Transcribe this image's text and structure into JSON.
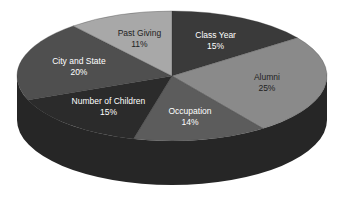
{
  "chart_data": {
    "type": "pie",
    "title": "",
    "style": "3d",
    "start_angle": "12 o'clock",
    "direction": "clockwise",
    "slices": [
      {
        "label": "Class Year",
        "value": 15,
        "display": "15%",
        "color": "#3a3a3a",
        "text_color": "#ffffff"
      },
      {
        "label": "Alumni",
        "value": 25,
        "display": "25%",
        "color": "#8a8a8a",
        "text_color": "#222222"
      },
      {
        "label": "Occupation",
        "value": 14,
        "display": "14%",
        "color": "#5c5c5c",
        "text_color": "#ffffff"
      },
      {
        "label": "Number of Children",
        "value": 15,
        "display": "15%",
        "color": "#2b2b2b",
        "text_color": "#ffffff"
      },
      {
        "label": "City and State",
        "value": 20,
        "display": "20%",
        "color": "#4f4f4f",
        "text_color": "#ffffff"
      },
      {
        "label": "Past Giving",
        "value": 11,
        "display": "11%",
        "color": "#a8a8a8",
        "text_color": "#222222"
      }
    ],
    "side_color": "#262626",
    "legend": "none"
  }
}
